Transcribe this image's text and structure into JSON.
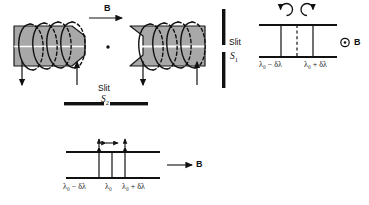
{
  "figure": {
    "title_semantic": "zeeman-effect-apparatus-and-spectra",
    "colors": {
      "pole_fill": "#a8a8a8",
      "pole_stroke": "#1a1a1a",
      "coil_stroke": "#111111",
      "line": "#111111",
      "slit_bar": "#111111",
      "background": "#ffffff"
    }
  },
  "apparatus": {
    "field_label": "B",
    "slit1_label": "Slit",
    "slit1_name": "S",
    "slit1_sub": "1",
    "slit2_label": "Slit",
    "slit2_name": "S",
    "slit2_sub": "2",
    "source_dot": "light-source",
    "left_pole": "electromagnet-pole-left",
    "right_pole": "electromagnet-pole-right",
    "coil_turns": 4
  },
  "transverse_view": {
    "name": "longitudinal-observation-spectrum",
    "field_symbol": "⊙",
    "field_label": "B",
    "polarization_left": "counterclockwise-circular",
    "polarization_right": "clockwise-circular",
    "lines": [
      {
        "id": "line-minus",
        "label_html": "λ<sub>0</sub> − δλ",
        "style": "solid"
      },
      {
        "id": "line-center",
        "label_html": "",
        "style": "dashed"
      },
      {
        "id": "line-plus",
        "label_html": "λ<sub>0</sub> + δλ",
        "style": "solid"
      }
    ],
    "label_left": "λ₀ − δλ",
    "label_right": "λ₀ + δλ"
  },
  "longitudinal_view": {
    "name": "transverse-observation-spectrum",
    "field_label": "B",
    "field_arrow": "right",
    "lines": [
      {
        "id": "line-minus",
        "label": "λ₀ − δλ",
        "polarization": "vertical"
      },
      {
        "id": "line-center",
        "label": "λ₀",
        "polarization": "horizontal"
      },
      {
        "id": "line-plus",
        "label": "λ₀ + δλ",
        "polarization": "vertical"
      }
    ],
    "label_left": "λ₀ − δλ",
    "label_center": "λ₀",
    "label_right": "λ₀ + δλ"
  }
}
